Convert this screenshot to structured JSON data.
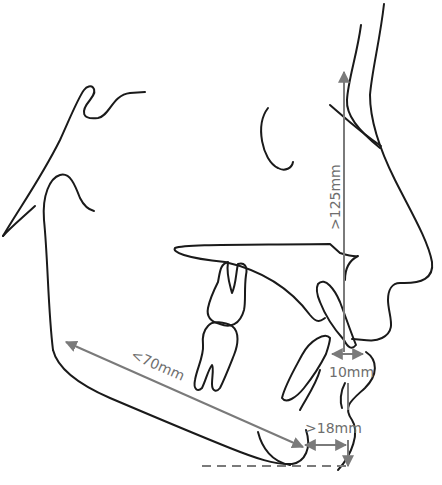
{
  "diagram": {
    "type": "cephalometric-lateral-profile",
    "colors": {
      "outline": "#1a1a1a",
      "measurement": "#7a7a7a",
      "label": "#6e6e6e",
      "background": "#ffffff"
    },
    "measurements": {
      "vertical_face_height": {
        "label": ">125mm",
        "orientation": "vertical"
      },
      "mandibular_body_length": {
        "label": "<70mm",
        "orientation": "diagonal"
      },
      "lip_distance": {
        "label": "10mm",
        "orientation": "horizontal"
      },
      "chin_distance": {
        "label": ">18mm",
        "orientation": "horizontal"
      }
    },
    "structures": [
      "soft-tissue-profile",
      "nose",
      "orbit",
      "maxilla-palate",
      "upper-molar",
      "lower-molar",
      "upper-incisor",
      "lower-incisor",
      "mandible",
      "ramus",
      "condyle",
      "chin"
    ]
  }
}
